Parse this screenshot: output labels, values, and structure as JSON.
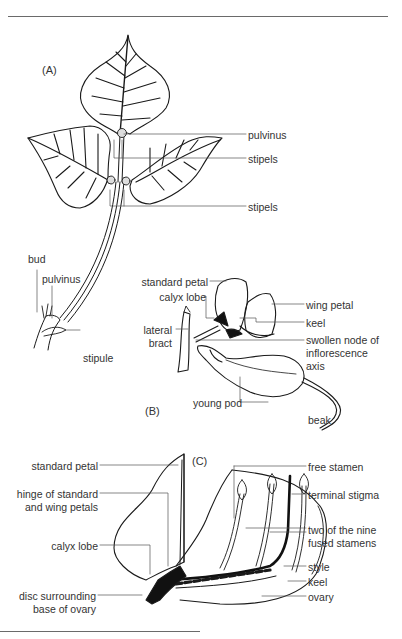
{
  "figure": {
    "panels": [
      {
        "id": "A",
        "label": "(A)"
      },
      {
        "id": "B",
        "label": "(B)"
      },
      {
        "id": "C",
        "label": "(C)"
      }
    ],
    "panel_a": {
      "pulvinus_upper": "pulvinus",
      "stipels_upper": "stipels",
      "stipels_lower": "stipels",
      "bud": "bud",
      "pulvinus_lower": "pulvinus",
      "stipule": "stipule"
    },
    "panel_b": {
      "standard_petal": "standard petal",
      "calyx_lobe": "calyx lobe",
      "lateral_bract_1": "lateral",
      "lateral_bract_2": "bract",
      "wing_petal": "wing petal",
      "keel": "keel",
      "swollen_node_1": "swollen node of",
      "swollen_node_2": "inflorescence",
      "swollen_node_3": "axis",
      "young_pod": "young pod",
      "beak": "beak"
    },
    "panel_c": {
      "standard_petal": "standard petal",
      "hinge_1": "hinge of standard",
      "hinge_2": "and wing petals",
      "calyx_lobe": "calyx lobe",
      "disc_1": "disc surrounding",
      "disc_2": "base of ovary",
      "free_stamen": "free stamen",
      "terminal_stigma": "terminal stigma",
      "fused_1": "two of the nine",
      "fused_2": "fused stamens",
      "style": "style",
      "keel": "keel",
      "ovary": "ovary"
    }
  }
}
